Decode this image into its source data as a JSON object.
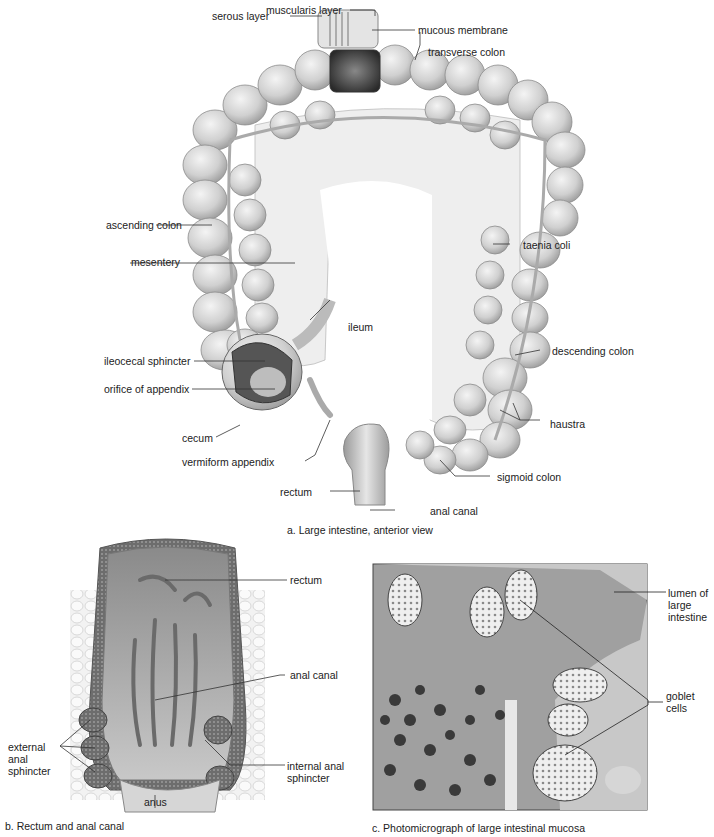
{
  "figure": {
    "panels": [
      {
        "id": "a",
        "caption": "a. Large intestine, anterior view",
        "labels": {
          "muscularis_layer": "muscularis layer",
          "mucous_membrane": "mucous membrane",
          "serous_layer": "serous layer",
          "transverse_colon": "transverse colon",
          "ascending_colon": "ascending colon",
          "mesentery": "mesentery",
          "taenia_coli": "taenia coli",
          "ileum": "ileum",
          "ileocecal_sphincter": "ileocecal sphincter",
          "orifice_of_appendix": "orifice of appendix",
          "descending_colon": "descending colon",
          "haustra": "haustra",
          "cecum": "cecum",
          "vermiform_appendix": "vermiform appendix",
          "sigmoid_colon": "sigmoid colon",
          "rectum": "rectum",
          "anal_canal": "anal canal"
        }
      },
      {
        "id": "b",
        "caption": "b. Rectum and anal canal",
        "labels": {
          "rectum": "rectum",
          "anal_canal": "anal canal",
          "external_anal_sphincter": "external anal sphincter",
          "internal_anal_sphincter": "internal anal sphincter",
          "anus": "anus"
        }
      },
      {
        "id": "c",
        "caption": "c. Photomicrograph of large intestinal mucosa",
        "labels": {
          "lumen": "lumen of large intestine",
          "goblet_cells": "goblet cells"
        }
      }
    ]
  }
}
